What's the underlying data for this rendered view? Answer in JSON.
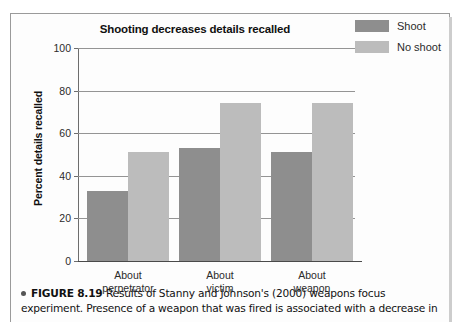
{
  "figure": {
    "caption_label": "FIGURE 8.19",
    "caption_text": "Results of Stanny and Johnson's (2000) weapons focus experiment. Presence of a weapon that was fired is associated with a decrease in",
    "bullet_icon": "bullet-dot-icon"
  },
  "chart_data": {
    "type": "bar",
    "title": "Shooting decreases details recalled",
    "xlabel": "",
    "ylabel": "Percent details recalled",
    "ylim": [
      0,
      100
    ],
    "yticks": [
      0,
      20,
      40,
      60,
      80,
      100
    ],
    "ytick_labels": [
      "0",
      "20",
      "40",
      "60",
      "80",
      "100"
    ],
    "grid": true,
    "legend_position": "top-right",
    "categories": [
      "About perpetrator",
      "About victim",
      "About weapon"
    ],
    "category_lines": [
      [
        "About",
        "perpetrator"
      ],
      [
        "About",
        "victim"
      ],
      [
        "About",
        "weapon"
      ]
    ],
    "series": [
      {
        "name": "Shoot",
        "color": "#8e8e8e",
        "values": [
          33,
          53,
          51
        ]
      },
      {
        "name": "No shoot",
        "color": "#bcbcbc",
        "values": [
          51,
          74,
          74
        ]
      }
    ]
  }
}
